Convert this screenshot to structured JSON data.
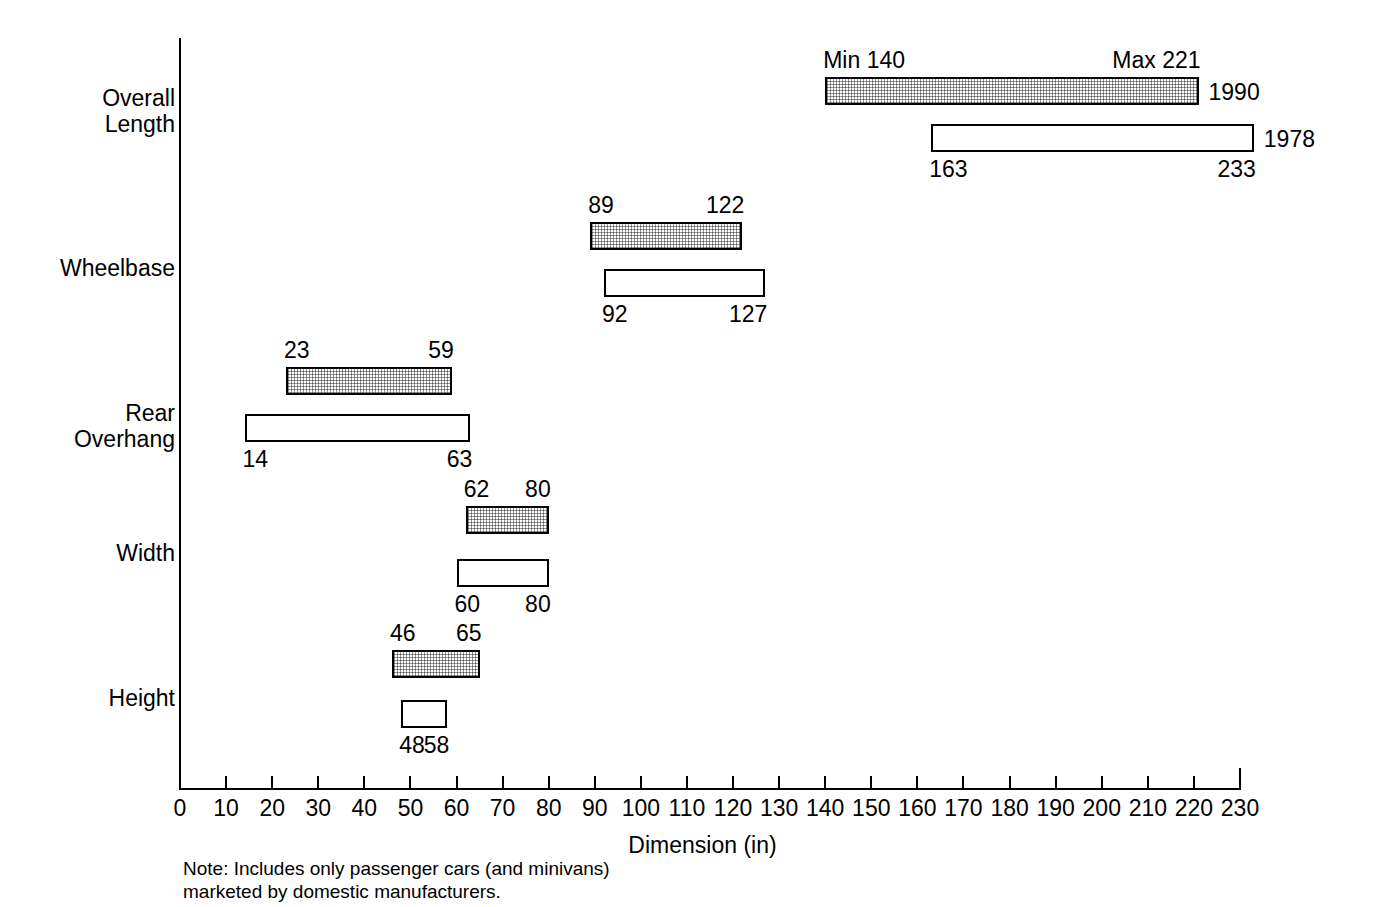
{
  "chart_data": {
    "type": "bar",
    "orientation": "horizontal",
    "title": "",
    "xlabel": "Dimension (in)",
    "ylabel": "",
    "xlim": [
      0,
      230
    ],
    "xticks": [
      0,
      10,
      20,
      30,
      40,
      50,
      60,
      70,
      80,
      90,
      100,
      110,
      120,
      130,
      140,
      150,
      160,
      170,
      180,
      190,
      200,
      210,
      220,
      230
    ],
    "grid": false,
    "legend": "inline-right",
    "categories": [
      "Overall Length",
      "Wheelbase",
      "Rear Overhang",
      "Width",
      "Height"
    ],
    "series": [
      {
        "name": "1990",
        "style": "shaded",
        "label_position": "above",
        "ranges": [
          {
            "category": "Overall Length",
            "min": 140,
            "max": 221,
            "min_label": "Min 140",
            "max_label": "Max 221"
          },
          {
            "category": "Wheelbase",
            "min": 89,
            "max": 122,
            "min_label": "89",
            "max_label": "122"
          },
          {
            "category": "Rear Overhang",
            "min": 23,
            "max": 59,
            "min_label": "23",
            "max_label": "59"
          },
          {
            "category": "Width",
            "min": 62,
            "max": 80,
            "min_label": "62",
            "max_label": "80"
          },
          {
            "category": "Height",
            "min": 46,
            "max": 65,
            "min_label": "46",
            "max_label": "65"
          }
        ]
      },
      {
        "name": "1978",
        "style": "open",
        "label_position": "below",
        "ranges": [
          {
            "category": "Overall Length",
            "min": 163,
            "max": 233,
            "min_label": "163",
            "max_label": "233"
          },
          {
            "category": "Wheelbase",
            "min": 92,
            "max": 127,
            "min_label": "92",
            "max_label": "127"
          },
          {
            "category": "Rear Overhang",
            "min": 14,
            "max": 63,
            "min_label": "14",
            "max_label": "63"
          },
          {
            "category": "Width",
            "min": 60,
            "max": 80,
            "min_label": "60",
            "max_label": "80"
          },
          {
            "category": "Height",
            "min": 48,
            "max": 58,
            "min_label": "48",
            "max_label": "58"
          }
        ]
      }
    ],
    "note": "Note:  Includes only passenger cars (and minivans)\nmarketed by domestic manufacturers."
  },
  "axis": {
    "x_title": "Dimension (in)",
    "tick_labels": [
      "0",
      "10",
      "20",
      "30",
      "40",
      "50",
      "60",
      "70",
      "80",
      "90",
      "100",
      "110",
      "120",
      "130",
      "140",
      "150",
      "160",
      "170",
      "180",
      "190",
      "200",
      "210",
      "220",
      "230"
    ]
  },
  "category_labels": [
    "Overall\nLength",
    "Wheelbase",
    "Rear\nOverhang",
    "Width",
    "Height"
  ],
  "year_labels": [
    "1990",
    "1978"
  ],
  "note_text": "Note:  Includes only passenger cars (and minivans)\nmarketed by domestic manufacturers."
}
